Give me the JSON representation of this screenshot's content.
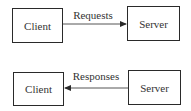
{
  "diagram": {
    "top": {
      "left_box": {
        "label": "Client"
      },
      "right_box": {
        "label": "Server"
      },
      "arrow": {
        "label": "Requests",
        "direction": "left-to-right"
      }
    },
    "bottom": {
      "left_box": {
        "label": "Client"
      },
      "right_box": {
        "label": "Server"
      },
      "arrow": {
        "label": "Responses",
        "direction": "right-to-left"
      }
    },
    "colors": {
      "stroke": "#2a2a2a",
      "text": "#333333",
      "background": "#ffffff"
    }
  }
}
